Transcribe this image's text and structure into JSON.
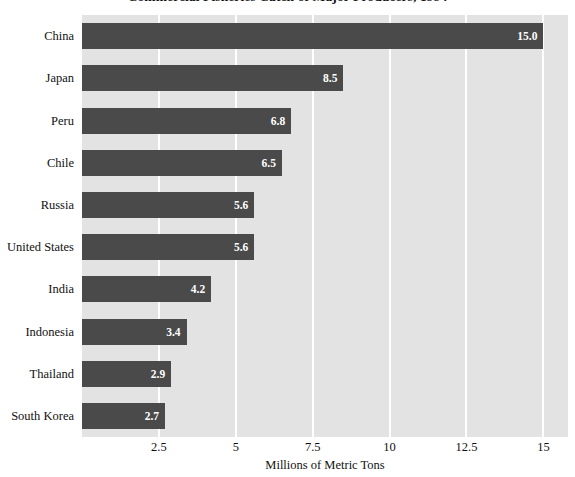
{
  "chart_data": {
    "type": "bar",
    "orientation": "horizontal",
    "title": "Commercial Fisheries Catch of Major Producers, 1994",
    "xlabel": "Millions of Metric Tons",
    "ylabel": "",
    "categories": [
      "China",
      "Japan",
      "Peru",
      "Chile",
      "Russia",
      "United States",
      "India",
      "Indonesia",
      "Thailand",
      "South Korea"
    ],
    "values": [
      15.0,
      8.5,
      6.8,
      6.5,
      5.6,
      5.6,
      4.2,
      3.4,
      2.9,
      2.7
    ],
    "value_labels": [
      "15.0",
      "8.5",
      "6.8",
      "6.5",
      "5.6",
      "5.6",
      "4.2",
      "3.4",
      "2.9",
      "2.7"
    ],
    "xlim": [
      0,
      15.8
    ],
    "xticks": [
      2.5,
      5,
      7.5,
      10,
      12.5,
      15
    ],
    "xtick_labels": [
      "2.5",
      "5",
      "7.5",
      "10",
      "12.5",
      "15"
    ],
    "grid": true,
    "grid_axis": "x",
    "legend": false,
    "colors": {
      "bar": "#4a4a4a",
      "plot_background": "#e3e3e3",
      "gridline": "#ffffff",
      "value_label": "#ffffff",
      "text": "#111111",
      "figure_background": "#ffffff"
    }
  }
}
